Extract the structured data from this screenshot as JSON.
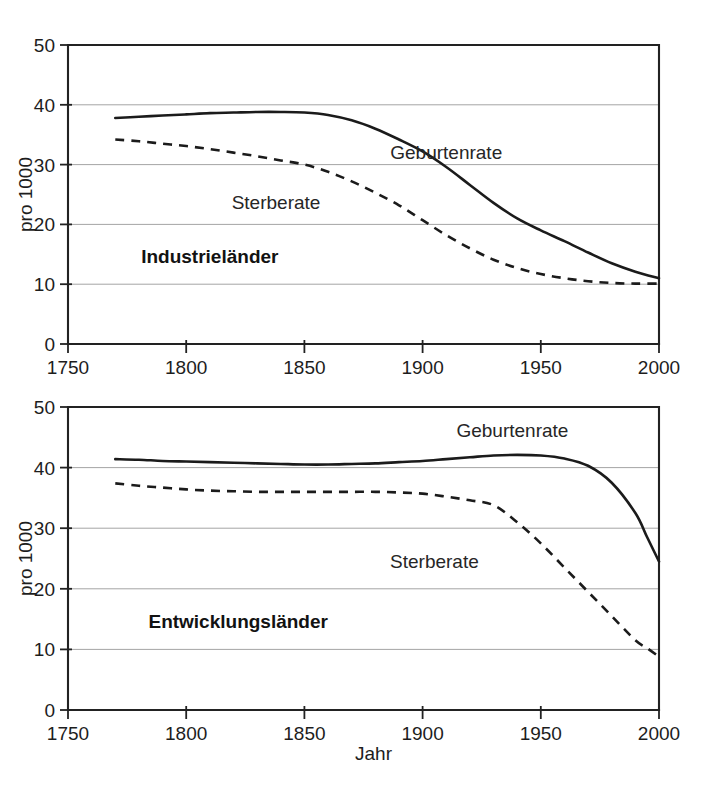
{
  "figure": {
    "background": "#ffffff",
    "ink_color": "#1b1b1b",
    "grid_color": "#9a9a9a"
  },
  "shared": {
    "xlabel": "Jahr",
    "ylabel": "pro 1000",
    "x_ticks": [
      "1750",
      "1800",
      "1850",
      "1900",
      "1950",
      "2000"
    ],
    "y_ticks": [
      "0",
      "10",
      "20",
      "30",
      "40",
      "50"
    ]
  },
  "chart_data": [
    {
      "type": "line",
      "title": "Industrieländer",
      "panel": "top",
      "xlabel": "",
      "ylabel": "pro 1000",
      "xlim": [
        1750,
        2000
      ],
      "ylim": [
        0,
        50
      ],
      "xticks": [
        1750,
        1800,
        1850,
        1900,
        1950,
        2000
      ],
      "yticks": [
        0,
        10,
        20,
        30,
        40,
        50
      ],
      "grid": true,
      "grid_axis": "y",
      "legend": "inline-annotation",
      "annotations": [
        {
          "text": "Industrieländer",
          "x": 1810,
          "y": 14.5,
          "bold": true
        },
        {
          "text": "Geburtenrate",
          "x": 1910,
          "y": 32.0,
          "bold": false
        },
        {
          "text": "Sterberate",
          "x": 1838,
          "y": 23.5,
          "bold": false
        }
      ],
      "x": [
        1770,
        1780,
        1790,
        1800,
        1810,
        1820,
        1830,
        1840,
        1850,
        1860,
        1870,
        1880,
        1890,
        1900,
        1910,
        1920,
        1930,
        1940,
        1950,
        1960,
        1970,
        1980,
        1990,
        2000
      ],
      "series": [
        {
          "name": "Geburtenrate",
          "style": "solid",
          "values": [
            37.8,
            38.0,
            38.2,
            38.4,
            38.6,
            38.7,
            38.8,
            38.8,
            38.7,
            38.3,
            37.4,
            36.0,
            34.2,
            32.2,
            29.6,
            26.6,
            23.6,
            21.0,
            19.0,
            17.2,
            15.3,
            13.5,
            12.1,
            11.0
          ]
        },
        {
          "name": "Sterberate",
          "style": "dashed",
          "values": [
            34.2,
            33.9,
            33.5,
            33.1,
            32.6,
            32.0,
            31.4,
            30.7,
            30.0,
            28.8,
            27.2,
            25.3,
            23.2,
            20.7,
            18.2,
            16.0,
            14.1,
            12.7,
            11.7,
            11.0,
            10.5,
            10.2,
            10.1,
            10.1
          ]
        }
      ]
    },
    {
      "type": "line",
      "title": "Entwicklungsländer",
      "panel": "bottom",
      "xlabel": "Jahr",
      "ylabel": "pro 1000",
      "xlim": [
        1750,
        2000
      ],
      "ylim": [
        0,
        50
      ],
      "xticks": [
        1750,
        1800,
        1850,
        1900,
        1950,
        2000
      ],
      "yticks": [
        0,
        10,
        20,
        30,
        40,
        50
      ],
      "grid": true,
      "grid_axis": "y",
      "legend": "inline-annotation",
      "annotations": [
        {
          "text": "Entwicklungsländer",
          "x": 1822,
          "y": 14.5,
          "bold": true
        },
        {
          "text": "Geburtenrate",
          "x": 1938,
          "y": 46.0,
          "bold": false
        },
        {
          "text": "Sterberate",
          "x": 1905,
          "y": 24.5,
          "bold": false
        }
      ],
      "x": [
        1770,
        1780,
        1790,
        1800,
        1810,
        1820,
        1830,
        1840,
        1850,
        1860,
        1870,
        1880,
        1890,
        1900,
        1910,
        1920,
        1930,
        1940,
        1950,
        1960,
        1970,
        1980,
        1990,
        1995,
        2000
      ],
      "series": [
        {
          "name": "Geburtenrate",
          "style": "solid",
          "values": [
            41.4,
            41.3,
            41.1,
            41.0,
            40.9,
            40.8,
            40.7,
            40.6,
            40.5,
            40.5,
            40.6,
            40.7,
            40.9,
            41.1,
            41.4,
            41.7,
            42.0,
            42.1,
            42.0,
            41.5,
            40.3,
            37.5,
            32.5,
            28.5,
            24.5
          ]
        },
        {
          "name": "Sterberate",
          "style": "dashed",
          "values": [
            37.4,
            37.0,
            36.7,
            36.4,
            36.2,
            36.1,
            36.0,
            36.0,
            36.0,
            36.0,
            36.0,
            36.0,
            35.9,
            35.7,
            35.2,
            34.6,
            33.8,
            31.0,
            27.5,
            23.5,
            19.5,
            15.5,
            11.5,
            10.2,
            8.8
          ]
        }
      ]
    }
  ]
}
